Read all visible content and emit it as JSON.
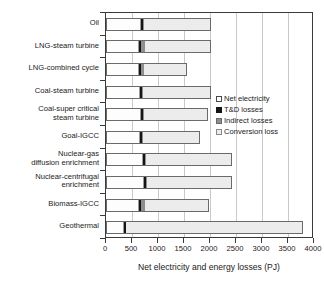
{
  "chart_data": {
    "type": "bar",
    "orientation": "horizontal",
    "stacked": true,
    "title": "",
    "xlabel": "Net electricity and energy losses (PJ)",
    "ylabel": "",
    "xlim": [
      0,
      4000
    ],
    "xticks": [
      0,
      500,
      1000,
      1500,
      2000,
      2500,
      3000,
      3500,
      4000
    ],
    "grid": true,
    "legend_position": "upper-right-inside",
    "categories": [
      "Oil",
      "LNG-steam turbine",
      "LNG-combined cycle",
      "Coal-steam turbine",
      "Coal-super critical\nsteam turbine",
      "Goal-IGCC",
      "Nuclear-gas\ndiffusion enrichment",
      "Nuclear-centrifugal\nenrichment",
      "Biomass-IGCC",
      "Geothermal"
    ],
    "series": [
      {
        "name": "Net electricity",
        "color": "#fdfdfd",
        "values": [
          660,
          620,
          625,
          650,
          660,
          640,
          700,
          720,
          620,
          330
        ]
      },
      {
        "name": "T&D losses",
        "color": "#151515",
        "values": [
          50,
          40,
          40,
          45,
          45,
          45,
          50,
          50,
          40,
          30
        ]
      },
      {
        "name": "Indirect losses",
        "color": "#8e8e8e",
        "values": [
          10,
          80,
          70,
          15,
          15,
          15,
          15,
          15,
          80,
          10
        ]
      },
      {
        "name": "Conversion loss",
        "color": "#ececec",
        "values": [
          1290,
          1270,
          815,
          1300,
          1240,
          1110,
          1665,
          1645,
          1250,
          3410
        ]
      }
    ],
    "totals": [
      2010,
      2010,
      1550,
      2010,
      1960,
      1810,
      2430,
      2430,
      1990,
      3780
    ]
  },
  "legend": {
    "items": [
      {
        "label": "Net electricity",
        "swatch": "#fdfdfd",
        "border": "#4a4a4a"
      },
      {
        "label": "T&D losses",
        "swatch": "#151515",
        "border": "#151515"
      },
      {
        "label": "Indirect losses",
        "swatch": "#8e8e8e",
        "border": "#6a6a6a"
      },
      {
        "label": "Conversion loss",
        "swatch": "#ececec",
        "border": "#8a8a8a"
      }
    ]
  },
  "axis": {
    "x_title": "Net electricity and energy losses (PJ)",
    "tick_labels": [
      "0",
      "500",
      "1000",
      "1500",
      "2000",
      "2500",
      "3000",
      "3500",
      "4000"
    ]
  }
}
